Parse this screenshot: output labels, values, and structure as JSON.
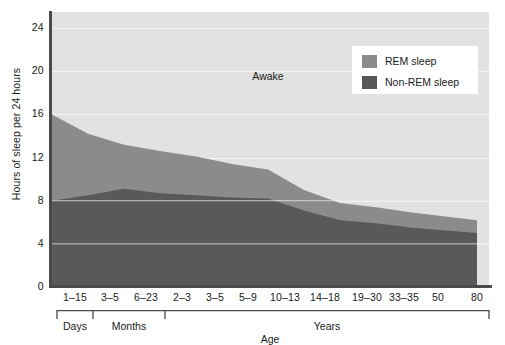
{
  "chart_data": {
    "type": "area",
    "title": "",
    "xlabel": "Age",
    "ylabel": "Hours of sleep per 24 hours",
    "ylim": [
      0,
      25.5
    ],
    "yticks": [
      0,
      4,
      8,
      12,
      16,
      20,
      24
    ],
    "grid": true,
    "stacked": true,
    "legend_position": "top-right",
    "categories": [
      "1–15",
      "3–5",
      "6–23",
      "2–3",
      "3–5",
      "5–9",
      "10–13",
      "14–18",
      "19–30",
      "33–35",
      "50",
      "80"
    ],
    "category_groups": [
      {
        "label": "Days",
        "categories": [
          "1–15"
        ]
      },
      {
        "label": "Months",
        "categories": [
          "3–5",
          "6–23"
        ]
      },
      {
        "label": "Years",
        "categories": [
          "2–3",
          "3–5",
          "5–9",
          "10–13",
          "14–18",
          "19–30",
          "33–35",
          "50",
          "80"
        ]
      }
    ],
    "series": [
      {
        "name": "Non-REM sleep",
        "color": "#595959",
        "values": [
          8.0,
          8.5,
          9.1,
          8.7,
          8.5,
          8.3,
          8.2,
          7.1,
          6.2,
          5.9,
          5.5,
          5.0
        ]
      },
      {
        "name": "REM sleep",
        "color": "#8b8b8b",
        "values": [
          8.0,
          5.7,
          4.1,
          3.9,
          3.6,
          3.1,
          2.7,
          1.9,
          1.6,
          1.5,
          1.4,
          1.2
        ]
      },
      {
        "name": "Awake",
        "color": "#e2e2e2",
        "values": [
          8.0,
          9.8,
          10.8,
          11.4,
          11.9,
          12.6,
          13.1,
          15.0,
          16.2,
          16.6,
          17.1,
          17.8
        ]
      }
    ],
    "total_sleep": [
      16.0,
      14.2,
      13.2,
      12.6,
      12.1,
      11.4,
      10.9,
      9.0,
      7.8,
      7.4,
      6.9,
      6.2
    ],
    "annotations": [
      {
        "text": "Awake",
        "x_category": "10–13",
        "y_value": 19.6
      }
    ]
  },
  "legend": {
    "items": [
      {
        "label": "REM sleep",
        "color": "#8b8b8b"
      },
      {
        "label": "Non-REM sleep",
        "color": "#595959"
      }
    ]
  },
  "colors": {
    "awake": "#e2e2e2",
    "rem": "#8b8b8b",
    "non_rem": "#595959",
    "axis": "#4a4a4a",
    "gridline": "#f4f4f4",
    "text": "#1a1a1a",
    "legend_background": "#ffffff"
  }
}
